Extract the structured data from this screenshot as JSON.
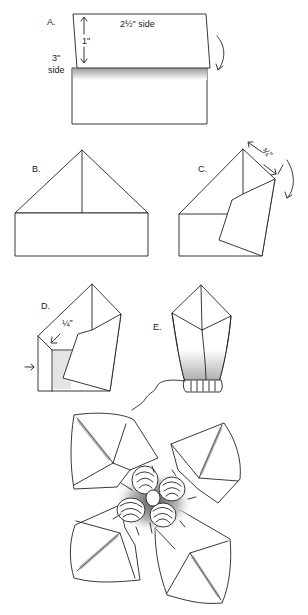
{
  "figure": {
    "steps": [
      {
        "id": "A",
        "label": "A.",
        "annotations": [
          "2½\" side",
          "1\"",
          "3\"",
          "side"
        ]
      },
      {
        "id": "B",
        "label": "B.",
        "annotations": []
      },
      {
        "id": "C",
        "label": "C.",
        "annotations": [
          "¾\""
        ]
      },
      {
        "id": "D",
        "label": "D.",
        "annotations": [
          "¼\""
        ]
      },
      {
        "id": "E",
        "label": "E.",
        "annotations": []
      }
    ],
    "final": {
      "description": "Finished napkin opened into four folded petals with small flowers in the center"
    },
    "colors": {
      "ink": "#222222",
      "background": "#ffffff",
      "shade": "#bbbbbb"
    }
  },
  "labels": {
    "a": "A.",
    "a_top": "2½\" side",
    "a_one_inch": "1\"",
    "a_three": "3\"",
    "a_side": "side",
    "b": "B.",
    "c": "C.",
    "c_measure": "¾\"",
    "d": "D.",
    "d_measure": "¼\"",
    "e": "E."
  }
}
